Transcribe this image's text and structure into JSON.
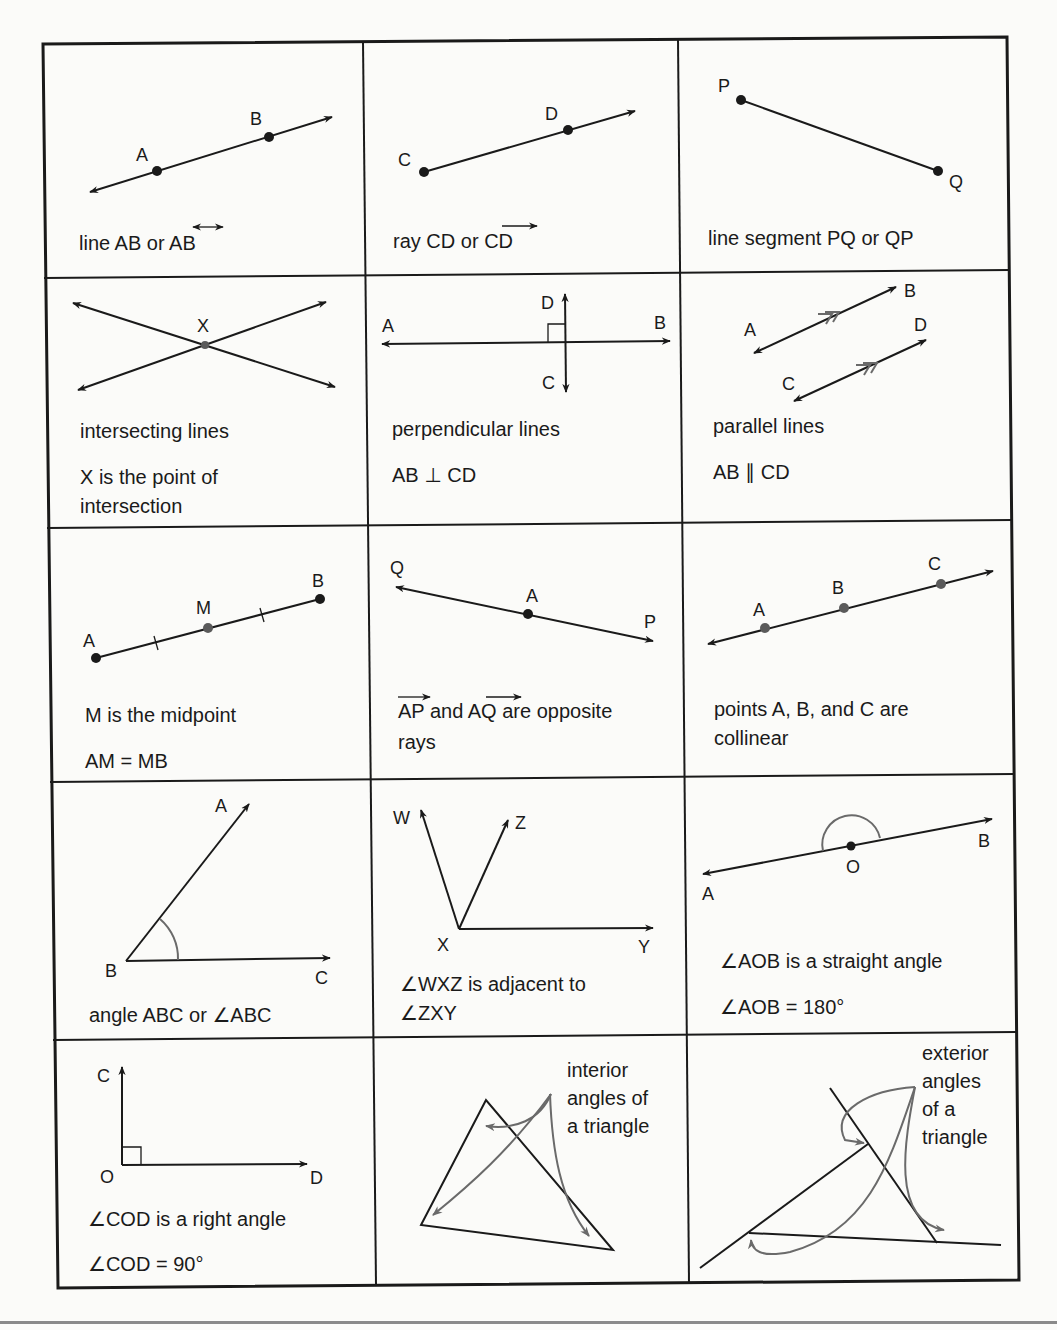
{
  "cells": [
    {
      "row": 1,
      "col": 1,
      "name": "line",
      "labels": [
        "A",
        "B"
      ],
      "caption": [
        "line AB or ",
        "AB"
      ],
      "notation": "line-overbar-double-arrow"
    },
    {
      "row": 1,
      "col": 2,
      "name": "ray",
      "labels": [
        "C",
        "D"
      ],
      "caption": [
        "ray CD or ",
        "CD"
      ],
      "notation": "ray-overbar-arrow"
    },
    {
      "row": 1,
      "col": 3,
      "name": "line-segment",
      "labels": [
        "P",
        "Q"
      ],
      "caption": [
        "line segment PQ or QP"
      ]
    },
    {
      "row": 2,
      "col": 1,
      "name": "intersecting-lines",
      "labels": [
        "X"
      ],
      "caption": [
        "intersecting lines",
        "X is the point of",
        "intersection"
      ]
    },
    {
      "row": 2,
      "col": 2,
      "name": "perpendicular-lines",
      "labels": [
        "A",
        "B",
        "C",
        "D"
      ],
      "caption": [
        "perpendicular lines",
        "AB ⊥ CD"
      ]
    },
    {
      "row": 2,
      "col": 3,
      "name": "parallel-lines",
      "labels": [
        "A",
        "B",
        "C",
        "D"
      ],
      "caption": [
        "parallel lines",
        "AB ∥ CD"
      ]
    },
    {
      "row": 3,
      "col": 1,
      "name": "midpoint",
      "labels": [
        "A",
        "M",
        "B"
      ],
      "caption": [
        "M is the midpoint",
        "AM = MB"
      ]
    },
    {
      "row": 3,
      "col": 2,
      "name": "opposite-rays",
      "labels": [
        "Q",
        "A",
        "P"
      ],
      "caption": [
        "AP",
        " and ",
        "AQ",
        " are opposite",
        "rays"
      ]
    },
    {
      "row": 3,
      "col": 3,
      "name": "collinear-points",
      "labels": [
        "A",
        "B",
        "C"
      ],
      "caption": [
        "points A, B, and C are",
        "collinear"
      ]
    },
    {
      "row": 4,
      "col": 1,
      "name": "angle",
      "labels": [
        "A",
        "B",
        "C"
      ],
      "caption": [
        "angle ABC or ∠ABC"
      ]
    },
    {
      "row": 4,
      "col": 2,
      "name": "adjacent-angles",
      "labels": [
        "W",
        "Z",
        "X",
        "Y"
      ],
      "caption": [
        "∠WXZ is adjacent to",
        "∠ZXY"
      ]
    },
    {
      "row": 4,
      "col": 3,
      "name": "straight-angle",
      "labels": [
        "O",
        "B",
        "A"
      ],
      "caption": [
        "∠AOB is a straight angle",
        "∠AOB = 180°"
      ]
    },
    {
      "row": 5,
      "col": 1,
      "name": "right-angle",
      "labels": [
        "C",
        "O",
        "D"
      ],
      "caption": [
        "∠COD is a right angle",
        "∠COD = 90°"
      ]
    },
    {
      "row": 5,
      "col": 2,
      "name": "interior-angles",
      "labels": [],
      "caption": [
        "interior",
        "angles of",
        "a triangle"
      ]
    },
    {
      "row": 5,
      "col": 3,
      "name": "exterior-angles",
      "labels": [],
      "caption": [
        "exterior",
        "angles",
        "of a",
        "triangle"
      ]
    }
  ]
}
